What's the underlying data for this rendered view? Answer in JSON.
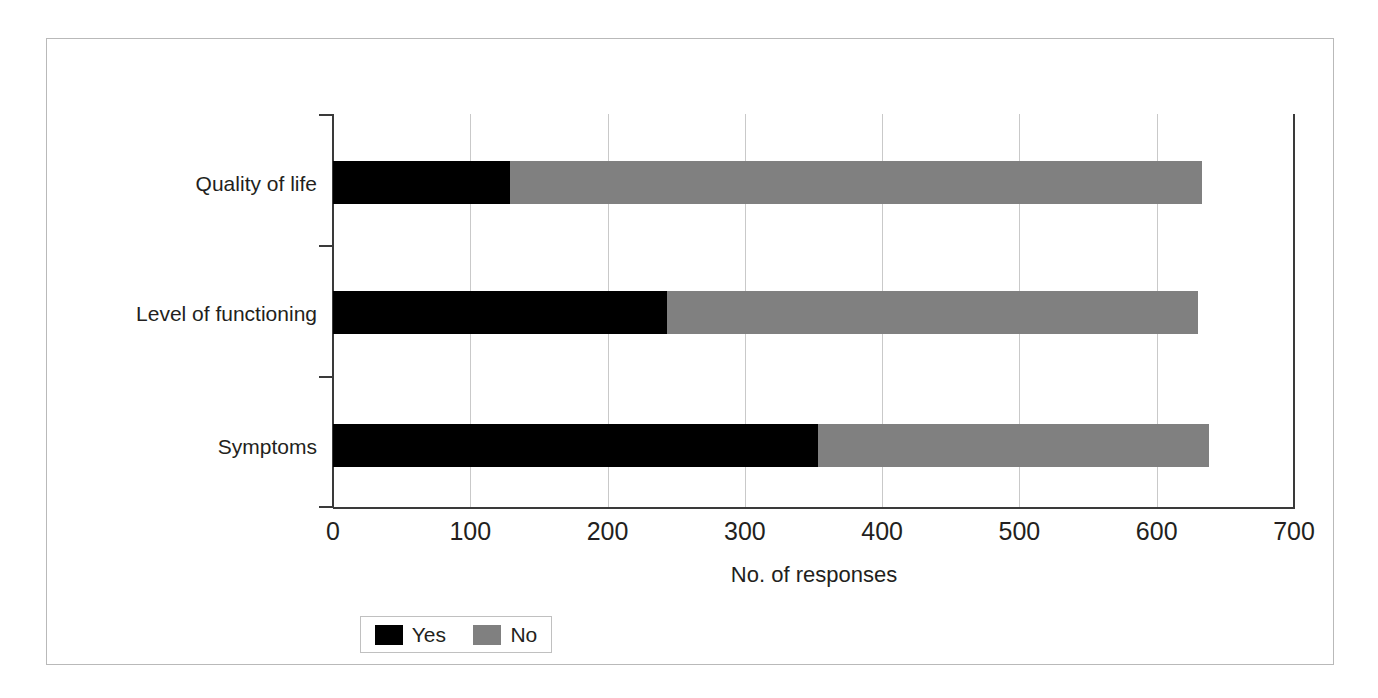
{
  "chart_data": {
    "type": "bar",
    "subtype": "horizontal-stacked",
    "title": "",
    "xlabel": "No. of responses",
    "ylabel": "",
    "xlim": [
      0,
      700
    ],
    "xticks": [
      0,
      100,
      200,
      300,
      400,
      500,
      600,
      700
    ],
    "grid": true,
    "legend_position": "bottom-left",
    "categories": [
      "Quality of life",
      "Level of functioning",
      "Symptoms"
    ],
    "series": [
      {
        "name": "Yes",
        "color": "#000000",
        "values": [
          129,
          243,
          353
        ]
      },
      {
        "name": "No",
        "color": "#808080",
        "values": [
          504,
          387,
          285
        ]
      }
    ],
    "totals": [
      633,
      630,
      638
    ]
  },
  "axis": {
    "x_title": "No. of responses",
    "tick_labels": [
      "0",
      "100",
      "200",
      "300",
      "400",
      "500",
      "600",
      "700"
    ]
  },
  "categories": [
    {
      "label": "Quality of life"
    },
    {
      "label": "Level of functioning"
    },
    {
      "label": "Symptoms"
    }
  ],
  "legend": {
    "items": [
      {
        "label": "Yes",
        "color": "#000000"
      },
      {
        "label": "No",
        "color": "#808080"
      }
    ]
  }
}
